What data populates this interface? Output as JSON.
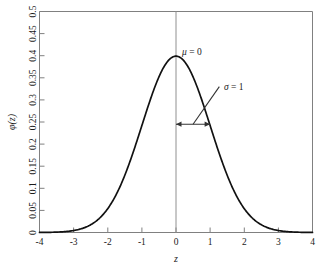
{
  "chart_data": {
    "type": "line",
    "title": "",
    "subtitle": "",
    "xlabel": "z",
    "ylabel": "φ(z)",
    "xlim": [
      -4,
      4
    ],
    "ylim": [
      0,
      0.5
    ],
    "grid": false,
    "legend": "none",
    "x_ticks": [
      "-4",
      "-3",
      "-2",
      "-1",
      "0",
      "1",
      "2",
      "3",
      "4"
    ],
    "x_tick_values": [
      -4,
      -3,
      -2,
      -1,
      0,
      1,
      2,
      3,
      4
    ],
    "y_ticks": [
      "0",
      "0.05",
      "0.1",
      "0.15",
      "0.2",
      "0.25",
      "0.3",
      "0.35",
      "0.4",
      "0.45",
      "0.5"
    ],
    "y_tick_values": [
      0,
      0.05,
      0.1,
      0.15,
      0.2,
      0.25,
      0.3,
      0.35,
      0.4,
      0.45,
      0.5
    ],
    "series": [
      {
        "name": "standard normal density",
        "x": [
          -4,
          -3.8,
          -3.6,
          -3.4,
          -3.2,
          -3,
          -2.8,
          -2.6,
          -2.4,
          -2.2,
          -2,
          -1.8,
          -1.6,
          -1.4,
          -1.2,
          -1,
          -0.8,
          -0.6,
          -0.4,
          -0.2,
          0,
          0.2,
          0.4,
          0.6,
          0.8,
          1,
          1.2,
          1.4,
          1.6,
          1.8,
          2,
          2.2,
          2.4,
          2.6,
          2.8,
          3,
          3.2,
          3.4,
          3.6,
          3.8,
          4
        ],
        "values": [
          0.0001,
          0.0003,
          0.0006,
          0.0012,
          0.0024,
          0.0044,
          0.0079,
          0.0136,
          0.0224,
          0.0355,
          0.054,
          0.079,
          0.1109,
          0.1497,
          0.1942,
          0.242,
          0.2897,
          0.3332,
          0.3683,
          0.391,
          0.3989,
          0.391,
          0.3683,
          0.3332,
          0.2897,
          0.242,
          0.1942,
          0.1497,
          0.1109,
          0.079,
          0.054,
          0.0355,
          0.0224,
          0.0136,
          0.0079,
          0.0044,
          0.0024,
          0.0012,
          0.0006,
          0.0003,
          0.0001
        ]
      }
    ],
    "annotations": [
      {
        "name": "mean-label",
        "text_symbol": "μ",
        "text_rest": " = 0",
        "text": "μ = 0",
        "x": 0,
        "y": 0.43
      },
      {
        "name": "sigma-label",
        "text_symbol": "σ",
        "text_rest": " = 1",
        "text": "σ = 1",
        "x": 1.35,
        "y": 0.325
      }
    ],
    "markers": {
      "vertical_line_at": 0,
      "sigma_arrow": {
        "from_x": 0,
        "to_x": 1,
        "y": 0.245,
        "style": "double-headed"
      },
      "leader_line": {
        "from_x": 0.5,
        "from_y": 0.245,
        "to_x": 1.27,
        "to_y": 0.33
      }
    }
  }
}
